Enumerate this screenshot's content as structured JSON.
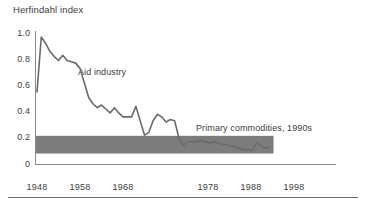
{
  "figure": {
    "axis_title": "Herfindahl index",
    "band_label": "Primary commodities, 1990s",
    "line_label": "Aid industry"
  },
  "axes": {
    "y_ticks": [
      "1.0",
      "0.8",
      "0.6",
      "0.4",
      "0.2",
      "0"
    ],
    "x_ticks": [
      "1948",
      "1958",
      "1968",
      "1978",
      "1988",
      "1998"
    ]
  },
  "colors": {
    "line": "#6b6b6b",
    "band": "#7c7c7c",
    "axis": "#8a8a8a",
    "text": "#3d3d3d",
    "rule": "#6f6f6f",
    "background": "#ffffff"
  },
  "chart_data": {
    "type": "line",
    "title": "",
    "subtitle": "",
    "xlabel": "",
    "ylabel": "Herfindahl index",
    "xlim": [
      1948,
      2002
    ],
    "ylim": [
      0,
      1.0
    ],
    "grid": false,
    "legend_position": "inline-annotations",
    "x_tick_values": [
      1948,
      1958,
      1968,
      1978,
      1988,
      1998
    ],
    "y_tick_values": [
      0,
      0.2,
      0.4,
      0.6,
      0.8,
      1.0
    ],
    "series": [
      {
        "name": "Aid industry",
        "label_position": {
          "x": 1959.5,
          "y": 0.63
        },
        "x": [
          1948,
          1949,
          1950,
          1951,
          1952,
          1953,
          1954,
          1955,
          1956,
          1957,
          1958,
          1959,
          1960,
          1961,
          1962,
          1963,
          1964,
          1965,
          1966,
          1967,
          1968,
          1969,
          1970,
          1971,
          1972,
          1973,
          1974,
          1975,
          1976,
          1977,
          1978,
          1979,
          1980,
          1981,
          1982,
          1983,
          1984,
          1985,
          1986,
          1987,
          1988,
          1989,
          1990,
          1991,
          1992,
          1993,
          1994,
          1995,
          1996,
          1997,
          1998,
          1999,
          2000,
          2001,
          2002
        ],
        "values": [
          0.55,
          0.97,
          0.92,
          0.86,
          0.82,
          0.79,
          0.83,
          0.79,
          0.78,
          0.77,
          0.73,
          0.62,
          0.51,
          0.46,
          0.43,
          0.45,
          0.42,
          0.39,
          0.43,
          0.39,
          0.36,
          0.36,
          0.36,
          0.44,
          0.33,
          0.22,
          0.24,
          0.33,
          0.38,
          0.36,
          0.32,
          0.34,
          0.33,
          0.2,
          0.14,
          0.17,
          0.17,
          0.17,
          0.18,
          0.17,
          0.16,
          0.17,
          0.16,
          0.15,
          0.15,
          0.14,
          0.13,
          0.12,
          0.11,
          0.11,
          0.1,
          0.16,
          0.14,
          0.12,
          0.13
        ]
      }
    ],
    "bands": [
      {
        "name": "Primary commodities, 1990s",
        "y_low": 0.08,
        "y_high": 0.215,
        "x_start": 1948,
        "x_end": 2003,
        "label_position": {
          "x": 1981,
          "y": 0.29
        }
      }
    ]
  }
}
